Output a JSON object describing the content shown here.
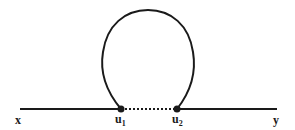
{
  "diagram": {
    "type": "feynman-loop",
    "line_color": "#1a1a1a",
    "background": "#ffffff",
    "endpoints": {
      "left": {
        "label": "x"
      },
      "right": {
        "label": "y"
      }
    },
    "vertices": [
      {
        "label": "u",
        "subscript": "1"
      },
      {
        "label": "u",
        "subscript": "2"
      }
    ],
    "edges": [
      {
        "from": "x",
        "to": "u1",
        "style": "solid"
      },
      {
        "from": "u1",
        "to": "u2",
        "style": "dotted"
      },
      {
        "from": "u2",
        "to": "y",
        "style": "solid"
      },
      {
        "from": "u1",
        "to": "u2",
        "style": "solid-loop"
      }
    ]
  }
}
